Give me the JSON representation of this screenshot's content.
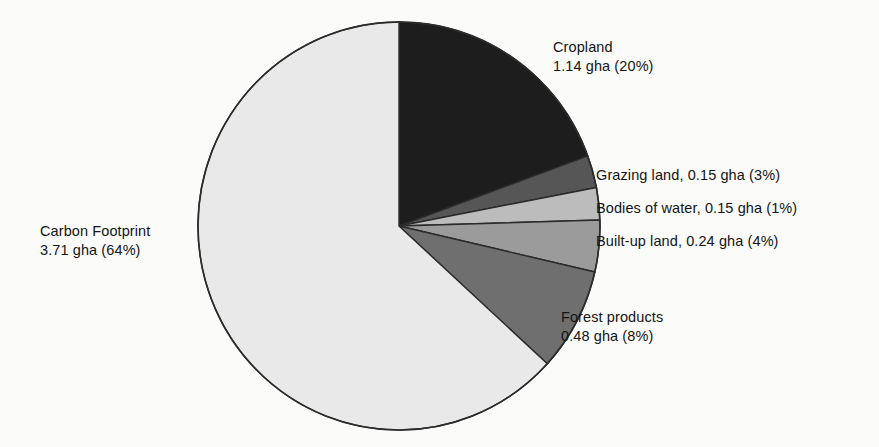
{
  "figure": {
    "background_color": "#fbfbfa",
    "text_color": "#141414",
    "outline_color": "#2b2b2b"
  },
  "chart_data": {
    "type": "pie",
    "title": "",
    "unit": "gha",
    "total_gha": 5.87,
    "start_angle_deg": 0,
    "direction": "clockwise",
    "legend_position": "callout-labels",
    "grid": false,
    "categories": [
      "Cropland",
      "Grazing land",
      "Bodies of water",
      "Built-up land",
      "Forest products",
      "Carbon Footprint"
    ],
    "values": [
      1.14,
      0.15,
      0.15,
      0.24,
      0.48,
      3.71
    ],
    "percentages": [
      20,
      3,
      1,
      4,
      8,
      64
    ],
    "colors": [
      "#1d1d1d",
      "#565656",
      "#bcbcbc",
      "#9b9b9b",
      "#6f6f6f",
      "#e9e9e9"
    ],
    "slices": [
      {
        "name": "Cropland",
        "value": 1.14,
        "percent": 20,
        "color": "#1d1d1d",
        "label_line1": "Cropland",
        "label_line2": "1.14 gha (20%)"
      },
      {
        "name": "Grazing land",
        "value": 0.15,
        "percent": 3,
        "color": "#565656",
        "label_line1": "Grazing land, 0.15 gha (3%)",
        "label_line2": ""
      },
      {
        "name": "Bodies of water",
        "value": 0.15,
        "percent": 1,
        "color": "#bcbcbc",
        "label_line1": "Bodies of water, 0.15 gha  (1%)",
        "label_line2": ""
      },
      {
        "name": "Built-up land",
        "value": 0.24,
        "percent": 4,
        "color": "#9b9b9b",
        "label_line1": "Built-up land, 0.24 gha (4%)",
        "label_line2": ""
      },
      {
        "name": "Forest products",
        "value": 0.48,
        "percent": 8,
        "color": "#6f6f6f",
        "label_line1": "Forest products",
        "label_line2": "0.48 gha (8%)"
      },
      {
        "name": "Carbon Footprint",
        "value": 3.71,
        "percent": 64,
        "color": "#e9e9e9",
        "label_line1": "Carbon Footprint",
        "label_line2": "3.71 gha (64%)"
      }
    ]
  },
  "geometry": {
    "center_x": 399,
    "center_y": 226,
    "radius_x": 201,
    "radius_y": 204
  }
}
